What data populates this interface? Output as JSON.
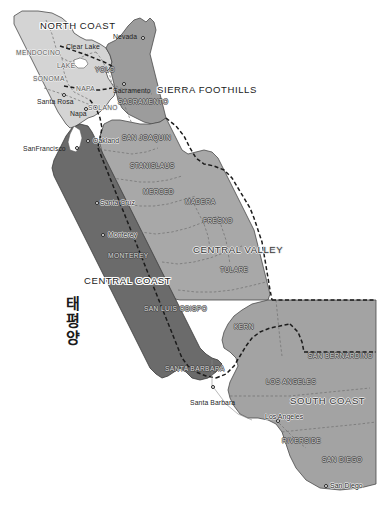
{
  "map": {
    "title": "California Wine Regions",
    "width": 379,
    "height": 505,
    "background_color": "#ffffff",
    "ocean_label": "태평양"
  },
  "palette": {
    "north_coast_fill": "#d2d2d2",
    "sierra_foothills_fill": "#9e9e9e",
    "central_valley_fill": "#a8a8a8",
    "central_coast_fill": "#6b6b6b",
    "south_coast_fill": "#a3a3a3",
    "outline": "#3a3a3a",
    "county_border": "#6e6e6e",
    "region_border": "#1c1c1c"
  },
  "regions": [
    {
      "id": "north-coast",
      "label": "NORTH COAST",
      "x": 40,
      "y": 21,
      "tone": "light"
    },
    {
      "id": "sierra-foothills",
      "label": "SIERRA FOOTHILLS",
      "x": 157,
      "y": 85,
      "tone": "light"
    },
    {
      "id": "central-valley",
      "label": "CENTRAL VALLEY",
      "x": 193,
      "y": 245,
      "tone": "dark"
    },
    {
      "id": "central-coast",
      "label": "CENTRAL COAST",
      "x": 84,
      "y": 276,
      "tone": "light"
    },
    {
      "id": "south-coast",
      "label": "SOUTH COAST",
      "x": 290,
      "y": 396,
      "tone": "dark"
    }
  ],
  "counties": [
    {
      "id": "mendocino",
      "label": "MENDOCINO",
      "x": 16,
      "y": 50,
      "on_dark": false
    },
    {
      "id": "lake",
      "label": "LAKE",
      "x": 57,
      "y": 63,
      "on_dark": false
    },
    {
      "id": "sonoma",
      "label": "SONOMA",
      "x": 33,
      "y": 76,
      "on_dark": false
    },
    {
      "id": "napa",
      "label": "NAPA",
      "x": 76,
      "y": 86,
      "on_dark": false
    },
    {
      "id": "yolo",
      "label": "YOLO",
      "x": 95,
      "y": 67,
      "on_dark": true
    },
    {
      "id": "solano",
      "label": "SOLANO",
      "x": 88,
      "y": 105,
      "on_dark": false
    },
    {
      "id": "sacramento",
      "label": "SACRAMENTO",
      "x": 118,
      "y": 99,
      "on_dark": true
    },
    {
      "id": "san-joaquin",
      "label": "SAN JOAQUIN",
      "x": 122,
      "y": 135,
      "on_dark": true
    },
    {
      "id": "stanislaus",
      "label": "STANISLAUS",
      "x": 130,
      "y": 163,
      "on_dark": true
    },
    {
      "id": "merced",
      "label": "MERCED",
      "x": 143,
      "y": 189,
      "on_dark": true
    },
    {
      "id": "madera",
      "label": "MADERA",
      "x": 185,
      "y": 199,
      "on_dark": true
    },
    {
      "id": "fresno",
      "label": "FRESNO",
      "x": 203,
      "y": 218,
      "on_dark": true
    },
    {
      "id": "tulare",
      "label": "TULARE",
      "x": 220,
      "y": 267,
      "on_dark": true
    },
    {
      "id": "monterey",
      "label": "MONTEREY",
      "x": 108,
      "y": 253,
      "on_dark": true
    },
    {
      "id": "san-luis-obispo",
      "label": "SAN LUIS OBISPO",
      "x": 144,
      "y": 306,
      "on_dark": true
    },
    {
      "id": "kern",
      "label": "KERN",
      "x": 234,
      "y": 324,
      "on_dark": true
    },
    {
      "id": "san-bernardino",
      "label": "SAN BERNARDINO",
      "x": 308,
      "y": 353,
      "on_dark": true
    },
    {
      "id": "santa-barbara",
      "label": "SANTA BARBARA",
      "x": 165,
      "y": 366,
      "on_dark": true
    },
    {
      "id": "los-angeles",
      "label": "LOS ANGELES",
      "x": 266,
      "y": 379,
      "on_dark": true
    },
    {
      "id": "riverside",
      "label": "RIVERSIDE",
      "x": 282,
      "y": 438,
      "on_dark": true
    },
    {
      "id": "san-diego",
      "label": "SAN DIEGO",
      "x": 322,
      "y": 457,
      "on_dark": true
    }
  ],
  "cities": [
    {
      "id": "clear-lake",
      "label": "Clear Lake",
      "label_x": 66,
      "label_y": 44,
      "dot_x": null,
      "dot_y": null,
      "on_fill": false
    },
    {
      "id": "nevada-city",
      "label": "Nevada",
      "label_x": 113,
      "label_y": 34,
      "dot_x": 141,
      "dot_y": 36,
      "on_fill": false
    },
    {
      "id": "santa-rosa",
      "label": "Santa Rosa",
      "label_x": 37,
      "label_y": 99,
      "dot_x": 62,
      "dot_y": 93,
      "on_fill": false
    },
    {
      "id": "napa-city",
      "label": "Napa",
      "label_x": 70,
      "label_y": 111,
      "dot_x": 84,
      "dot_y": 107,
      "on_fill": false
    },
    {
      "id": "sacramento-city",
      "label": "Sacramento",
      "label_x": 113,
      "label_y": 88,
      "dot_x": 122,
      "dot_y": 82,
      "on_fill": false
    },
    {
      "id": "san-francisco",
      "label": "SanFrancisco",
      "label_x": 23,
      "label_y": 146,
      "dot_x": 75,
      "dot_y": 146,
      "on_fill": false
    },
    {
      "id": "oakland",
      "label": "Oakland",
      "label_x": 93,
      "label_y": 138,
      "dot_x": 86,
      "dot_y": 139,
      "on_fill": true
    },
    {
      "id": "santa-cruz",
      "label": "Santa Cruz",
      "label_x": 100,
      "label_y": 200,
      "dot_x": 95,
      "dot_y": 201,
      "on_fill": true
    },
    {
      "id": "monterey-city",
      "label": "Monterey",
      "label_x": 108,
      "label_y": 232,
      "dot_x": 101,
      "dot_y": 233,
      "on_fill": true
    },
    {
      "id": "santa-barbara-city",
      "label": "Santa Barbara",
      "label_x": 190,
      "label_y": 400,
      "dot_x": 211,
      "dot_y": 385,
      "on_fill": false
    },
    {
      "id": "los-angeles-city",
      "label": "Los Angeles",
      "label_x": 265,
      "label_y": 414,
      "dot_x": 276,
      "dot_y": 419,
      "on_fill": true
    },
    {
      "id": "san-diego-city",
      "label": "San Diego",
      "label_x": 330,
      "label_y": 483,
      "dot_x": 324,
      "dot_y": 484,
      "on_fill": true
    }
  ]
}
